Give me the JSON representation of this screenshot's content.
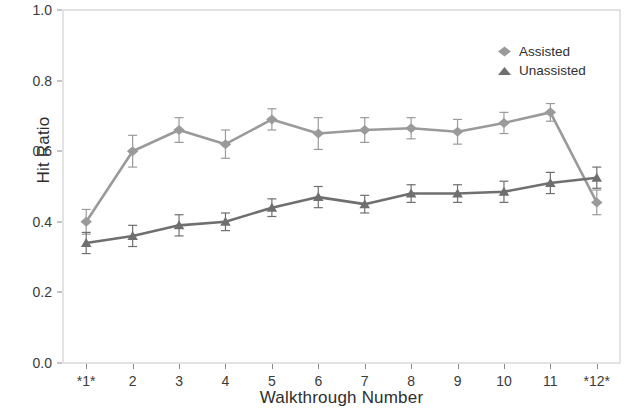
{
  "chart_data": {
    "type": "line",
    "title": "",
    "subtitle": "",
    "xlabel": "Walkthrough Number",
    "ylabel": "Hit Ratio",
    "categories": [
      "*1*",
      "2",
      "3",
      "4",
      "5",
      "6",
      "7",
      "8",
      "9",
      "10",
      "11",
      "*12*"
    ],
    "x_tick_labels": [
      "*1*",
      "2",
      "3",
      "4",
      "5",
      "6",
      "7",
      "8",
      "9",
      "10",
      "11",
      "*12*"
    ],
    "y_tick_labels": [
      "0.0",
      "0.2",
      "0.4",
      "0.6",
      "0.8",
      "1.0"
    ],
    "y_tick_values": [
      0.0,
      0.2,
      0.4,
      0.6,
      0.8,
      1.0
    ],
    "ylim": [
      0.0,
      1.0
    ],
    "xlim": [
      0.5,
      12.5
    ],
    "grid": false,
    "legend_position": "top-right",
    "error_bars": true,
    "series": [
      {
        "name": "Assisted",
        "marker": "diamond",
        "color": "#9a9a9a",
        "values": [
          0.4,
          0.6,
          0.66,
          0.62,
          0.69,
          0.65,
          0.66,
          0.665,
          0.655,
          0.68,
          0.71,
          0.455
        ],
        "errors": [
          0.035,
          0.045,
          0.035,
          0.04,
          0.03,
          0.045,
          0.035,
          0.03,
          0.035,
          0.03,
          0.025,
          0.035
        ]
      },
      {
        "name": "Unassisted",
        "marker": "triangle",
        "color": "#6f6f6f",
        "values": [
          0.34,
          0.36,
          0.39,
          0.4,
          0.44,
          0.47,
          0.45,
          0.48,
          0.48,
          0.485,
          0.51,
          0.525
        ],
        "errors": [
          0.03,
          0.03,
          0.03,
          0.025,
          0.025,
          0.03,
          0.025,
          0.025,
          0.025,
          0.03,
          0.03,
          0.03
        ]
      }
    ]
  },
  "axes": {
    "y_title": "Hit Ratio",
    "x_title": "Walkthrough Number"
  },
  "legend": {
    "entries": [
      {
        "label": "Assisted"
      },
      {
        "label": "Unassisted"
      }
    ]
  },
  "colors": {
    "assisted": "#9a9a9a",
    "unassisted": "#6f6f6f",
    "frame": "#c8c8c8",
    "text": "#2e2e2e"
  }
}
